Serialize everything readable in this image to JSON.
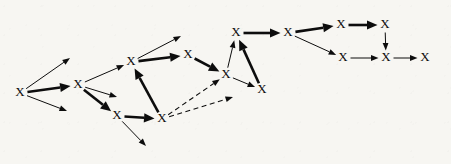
{
  "figure": {
    "kind": "directed-graph",
    "background_color": "#f7f6f2",
    "ink_color": "#0d0d0d",
    "width": 451,
    "height": 164,
    "node_glyph": "X",
    "node_count": 15,
    "edge_count": 23
  },
  "chart_data": {
    "type": "diagram",
    "title": "",
    "xlabel": "",
    "ylabel": "",
    "nodes": [
      {
        "id": "n1",
        "label": "X",
        "x": 20,
        "y": 93
      },
      {
        "id": "n2",
        "label": "X",
        "x": 78,
        "y": 85
      },
      {
        "id": "n3",
        "label": "X",
        "x": 131,
        "y": 62
      },
      {
        "id": "n4",
        "label": "X",
        "x": 117,
        "y": 116
      },
      {
        "id": "n5",
        "label": "X",
        "x": 162,
        "y": 119
      },
      {
        "id": "n6",
        "label": "X",
        "x": 188,
        "y": 55
      },
      {
        "id": "n7",
        "label": "X",
        "x": 226,
        "y": 75
      },
      {
        "id": "n8",
        "label": "X",
        "x": 236,
        "y": 33
      },
      {
        "id": "n9",
        "label": "X",
        "x": 262,
        "y": 90
      },
      {
        "id": "n10",
        "label": "X",
        "x": 288,
        "y": 33
      },
      {
        "id": "n11",
        "label": "X",
        "x": 341,
        "y": 25
      },
      {
        "id": "n12",
        "label": "X",
        "x": 343,
        "y": 58
      },
      {
        "id": "n13",
        "label": "X",
        "x": 385,
        "y": 25
      },
      {
        "id": "n14",
        "label": "X",
        "x": 386,
        "y": 58
      },
      {
        "id": "n15",
        "label": "X",
        "x": 425,
        "y": 58
      }
    ],
    "dangling_targets": [
      {
        "id": "d1",
        "x": 70,
        "y": 58
      },
      {
        "id": "d2",
        "x": 67,
        "y": 111
      },
      {
        "id": "d3",
        "x": 117,
        "y": 97
      },
      {
        "id": "d4",
        "x": 181,
        "y": 36
      },
      {
        "id": "d5",
        "x": 146,
        "y": 146
      },
      {
        "id": "d6",
        "x": 233,
        "y": 97
      }
    ],
    "edges": [
      {
        "from": "n1",
        "to": "d1",
        "style": "thin",
        "weight": 1
      },
      {
        "from": "n1",
        "to": "n2",
        "style": "thick",
        "weight": 3
      },
      {
        "from": "n1",
        "to": "d2",
        "style": "thin",
        "weight": 1
      },
      {
        "from": "n2",
        "to": "n3",
        "style": "thin",
        "weight": 1
      },
      {
        "from": "n2",
        "to": "d3",
        "style": "thin",
        "weight": 1
      },
      {
        "from": "n2",
        "to": "n4",
        "style": "thick",
        "weight": 3
      },
      {
        "from": "n3",
        "to": "d4",
        "style": "thin",
        "weight": 1
      },
      {
        "from": "n3",
        "to": "n6",
        "style": "thick",
        "weight": 3
      },
      {
        "from": "n4",
        "to": "n5",
        "style": "thick",
        "weight": 3
      },
      {
        "from": "n4",
        "to": "d5",
        "style": "thin",
        "weight": 1
      },
      {
        "from": "n5",
        "to": "n3",
        "style": "thick",
        "weight": 3
      },
      {
        "from": "n5",
        "to": "n7",
        "style": "dashed",
        "weight": 1
      },
      {
        "from": "n5",
        "to": "d6",
        "style": "dashed",
        "weight": 1
      },
      {
        "from": "n6",
        "to": "n7",
        "style": "thick",
        "weight": 3
      },
      {
        "from": "n7",
        "to": "n8",
        "style": "thin",
        "weight": 1
      },
      {
        "from": "n8",
        "to": "n10",
        "style": "thick",
        "weight": 3
      },
      {
        "from": "n9",
        "to": "n8",
        "style": "thick",
        "weight": 3
      },
      {
        "from": "n7",
        "to": "n9",
        "style": "thin",
        "weight": 1
      },
      {
        "from": "n10",
        "to": "n11",
        "style": "thick",
        "weight": 3
      },
      {
        "from": "n10",
        "to": "n12",
        "style": "thin",
        "weight": 1
      },
      {
        "from": "n11",
        "to": "n13",
        "style": "thick",
        "weight": 3
      },
      {
        "from": "n12",
        "to": "n14",
        "style": "thin",
        "weight": 1
      },
      {
        "from": "n13",
        "to": "n14",
        "style": "thin",
        "weight": 1
      },
      {
        "from": "n14",
        "to": "n15",
        "style": "thin",
        "weight": 1
      }
    ],
    "legend": [],
    "annotations": []
  }
}
